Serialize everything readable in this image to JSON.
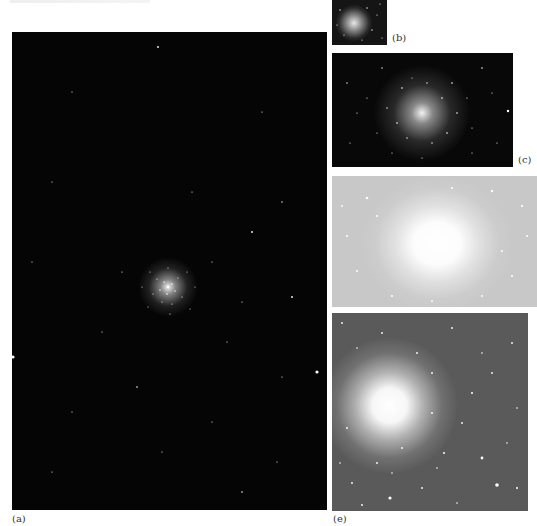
{
  "figure": {
    "panels": [
      {
        "id": "a",
        "label": "(a)",
        "background": "#050505",
        "description": "wide field, small cluster at center with scattered field stars"
      },
      {
        "id": "b",
        "label": "(b)",
        "background": "#151515",
        "description": "small thumbnail of cluster"
      },
      {
        "id": "c",
        "label": "(c)",
        "background": "#080808",
        "description": "cluster closer view on black background"
      },
      {
        "id": "d",
        "label": "",
        "background": "#c8c8c8",
        "description": "overexposed cluster on light gray background"
      },
      {
        "id": "e",
        "label": "(e)",
        "background": "#5a5a5a",
        "description": "cluster core on mid-gray background"
      }
    ]
  },
  "colors": {
    "page_background": "#ffffff",
    "label_text": "#333333",
    "star": "#ffffff"
  }
}
